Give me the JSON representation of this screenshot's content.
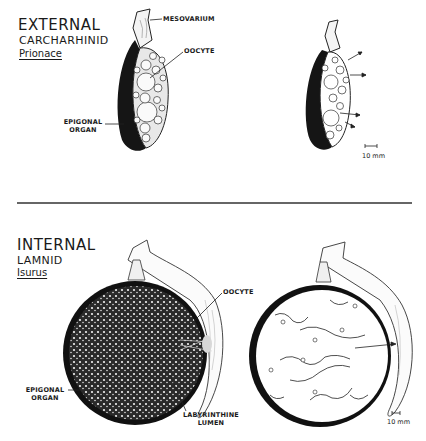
{
  "top_panel": {
    "title": "EXTERNAL",
    "group": "CARCHARHINID",
    "genus": "Prionace",
    "labels": {
      "mesovarium": "MESOVARIUM",
      "oocyte": "OOCYTE",
      "epigonal_line1": "EPIGONAL",
      "epigonal_line2": "ORGAN"
    },
    "scale_bar": "10 mm"
  },
  "bottom_panel": {
    "title": "INTERNAL",
    "group": "LAMNID",
    "genus": "Isurus",
    "labels": {
      "oocyte": "OOCYTE",
      "epigonal_line1": "EPIGONAL",
      "epigonal_line2": "ORGAN",
      "lumen_line1": "LABYRINTHINE",
      "lumen_line2": "LUMEN"
    },
    "scale_bar": "10 mm"
  },
  "colors": {
    "ink": "#1a1a1a",
    "paper": "#ffffff"
  }
}
